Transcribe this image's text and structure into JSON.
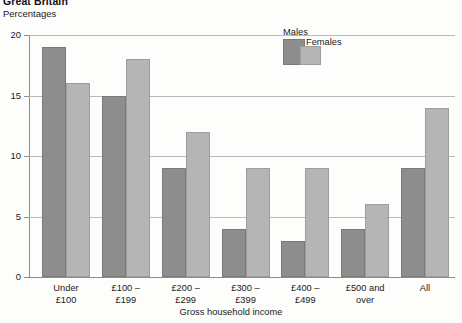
{
  "header": {
    "region_title": "Great Britain",
    "units_label": "Percentages"
  },
  "legend": {
    "male_label": "Males",
    "female_label": "Females",
    "male_color": "#8d8d8d",
    "female_color": "#b5b5b5"
  },
  "axes": {
    "x_title": "Gross household income",
    "y_ticks": [
      "0",
      "5",
      "10",
      "15",
      "20"
    ]
  },
  "categories_lines": [
    [
      "Under",
      "£100"
    ],
    [
      "£100 –",
      "£199"
    ],
    [
      "£200 –",
      "£299"
    ],
    [
      "£300 –",
      "£399"
    ],
    [
      "£400 –",
      "£499"
    ],
    [
      "£500 and",
      "over"
    ],
    [
      "All",
      ""
    ]
  ],
  "chart_data": {
    "type": "bar",
    "title": "Great Britain",
    "subtitle": "Percentages",
    "xlabel": "Gross household income",
    "ylabel": "Percentages",
    "ylim": [
      0,
      20
    ],
    "yticks": [
      0,
      5,
      10,
      15,
      20
    ],
    "grid": true,
    "legend_position": "top-right-inside",
    "categories": [
      "Under £100",
      "£100 – £199",
      "£200 – £299",
      "£300 – £399",
      "£400 – £499",
      "£500 and over",
      "All"
    ],
    "series": [
      {
        "name": "Males",
        "color": "#8d8d8d",
        "values": [
          19,
          15,
          9,
          4,
          3,
          4,
          9
        ]
      },
      {
        "name": "Females",
        "color": "#b5b5b5",
        "values": [
          16,
          18,
          12,
          9,
          9,
          6,
          14
        ]
      }
    ]
  }
}
